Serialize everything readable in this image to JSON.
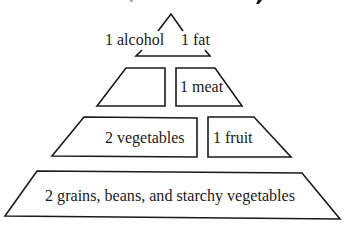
{
  "diagram": {
    "type": "food-pyramid",
    "title_partial": "",
    "colors": {
      "stroke": "#1a1a1a",
      "fill": "#ffffff",
      "text": "#1a1a1a"
    },
    "tiers": [
      {
        "level": 1,
        "items": [
          {
            "label": "1 alcohol"
          },
          {
            "label": "1 fat"
          }
        ]
      },
      {
        "level": 2,
        "items": [
          {
            "label": ""
          },
          {
            "label": "1 meat"
          }
        ]
      },
      {
        "level": 3,
        "items": [
          {
            "label": "2 vegetables"
          },
          {
            "label": "1 fruit"
          }
        ]
      },
      {
        "level": 4,
        "items": [
          {
            "label": "2 grains, beans, and starchy vegetables"
          }
        ]
      }
    ]
  }
}
